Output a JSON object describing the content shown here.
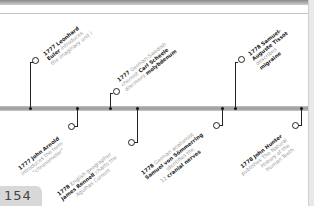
{
  "page": {
    "number": "154"
  },
  "events": [
    {
      "id": "euler",
      "year": "1777",
      "lines": [
        [
          {
            "t": "Leonhard",
            "b": true
          }
        ],
        [
          {
            "t": "Euler",
            "b": true
          },
          {
            "t": " introduces",
            "b": false
          }
        ],
        [
          {
            "t": "the imaginary unit ",
            "b": false
          },
          {
            "t": "i",
            "b": false
          }
        ]
      ],
      "position": "above"
    },
    {
      "id": "scheele",
      "year": "1777",
      "lines": [
        [
          {
            "t": "German-Swedish",
            "b": false
          }
        ],
        [
          {
            "t": "chemist ",
            "b": false
          },
          {
            "t": "Carl Scheele",
            "b": true
          }
        ],
        [
          {
            "t": "discovers ",
            "b": false
          },
          {
            "t": "molybdenum",
            "b": true
          }
        ]
      ],
      "position": "above"
    },
    {
      "id": "tissot",
      "year": "1778",
      "lines": [
        [
          {
            "t": "Samuel-",
            "b": true
          }
        ],
        [
          {
            "t": "Auguste Tissot",
            "b": true
          }
        ],
        [
          {
            "t": "describes",
            "b": false
          }
        ],
        [
          {
            "t": "migraine",
            "b": true
          }
        ]
      ],
      "position": "above"
    },
    {
      "id": "arnold",
      "year": "1777",
      "lines": [
        [
          {
            "t": "John Arnold",
            "b": true
          }
        ],
        [
          {
            "t": "introduces the term",
            "b": false
          }
        ],
        [
          {
            "t": "\"chronometer\"",
            "b": false
          }
        ]
      ],
      "position": "below"
    },
    {
      "id": "rennell",
      "year": "1778",
      "lines": [
        [
          {
            "t": "English geographer",
            "b": false
          }
        ],
        [
          {
            "t": "James Rennell",
            "b": true
          },
          {
            "t": " charts the",
            "b": false
          }
        ],
        [
          {
            "t": "Agulhas Current",
            "b": false
          }
        ]
      ],
      "position": "below"
    },
    {
      "id": "soemmerring",
      "year": "1778",
      "lines": [
        [
          {
            "t": "German anatomist",
            "b": false
          }
        ],
        [
          {
            "t": "Samuel von Sömmerring",
            "b": true
          }
        ],
        [
          {
            "t": "identifies the",
            "b": false
          }
        ],
        [
          {
            "t": "12 ",
            "b": false
          },
          {
            "t": "cranial nerves",
            "b": true
          }
        ]
      ],
      "position": "below"
    },
    {
      "id": "hunter",
      "year": "1778",
      "lines": [
        [
          {
            "t": "John Hunter",
            "b": true
          }
        ],
        [
          {
            "t": "publishes The Natural",
            "b": false
          }
        ],
        [
          {
            "t": "History of the",
            "b": false
          }
        ],
        [
          {
            "t": "Human Teeth",
            "b": false
          }
        ]
      ],
      "position": "below"
    }
  ],
  "text": {
    "euler_year": "1777",
    "euler_l1": "Leonhard",
    "euler_l2a": "Euler",
    "euler_l2b": " introduces",
    "euler_l3": "the imaginary unit i",
    "scheele_year": "1777",
    "scheele_l1": "German-Swedish",
    "scheele_l2a": "chemist ",
    "scheele_l2b": "Carl Scheele",
    "scheele_l3a": "discovers ",
    "scheele_l3b": "molybdenum",
    "tissot_year": "1778",
    "tissot_l1": "Samuel-",
    "tissot_l2": "Auguste Tissot",
    "tissot_l3": "describes",
    "tissot_l4": "migraine",
    "arnold_year": "1777",
    "arnold_l1": "John Arnold",
    "arnold_l2": "introduces the term",
    "arnold_l3": "\"chronometer\"",
    "rennell_year": "1778",
    "rennell_l1": "English geographer",
    "rennell_l2a": "James Rennell",
    "rennell_l2b": " charts the",
    "rennell_l3": "Agulhas Current",
    "soem_year": "1778",
    "soem_l1": "German anatomist",
    "soem_l2": "Samuel von Sömmerring",
    "soem_l3": "identifies the",
    "soem_l4a": "12 ",
    "soem_l4b": "cranial nerves",
    "hunter_year": "1778",
    "hunter_l1": "John Hunter",
    "hunter_l2": "publishes The Natural",
    "hunter_l3": "History of the",
    "hunter_l4": "Human Teeth"
  },
  "colors": {
    "axis": "#a8a8a8",
    "marker": "#222222",
    "bold_text": "#222222",
    "light_text": "#9a9a9a",
    "page_tab": "#d8d8d8"
  }
}
